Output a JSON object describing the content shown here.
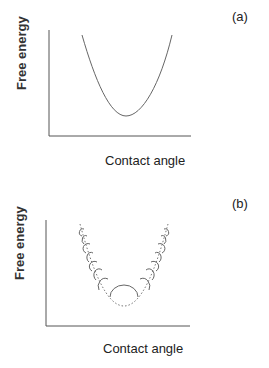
{
  "figure": {
    "panels": [
      {
        "tag": "(a)",
        "ylabel": "Free energy",
        "xlabel": "Contact angle",
        "description": "Smooth parabolic free energy curve with a single minimum"
      },
      {
        "tag": "(b)",
        "ylabel": "Free energy",
        "xlabel": "Contact angle",
        "description": "Dotted parabolic envelope with semicircular bumps (metastable states) along the curve"
      }
    ],
    "colors": {
      "axis": "#555555",
      "curve": "#666666",
      "text": "#222222"
    }
  }
}
